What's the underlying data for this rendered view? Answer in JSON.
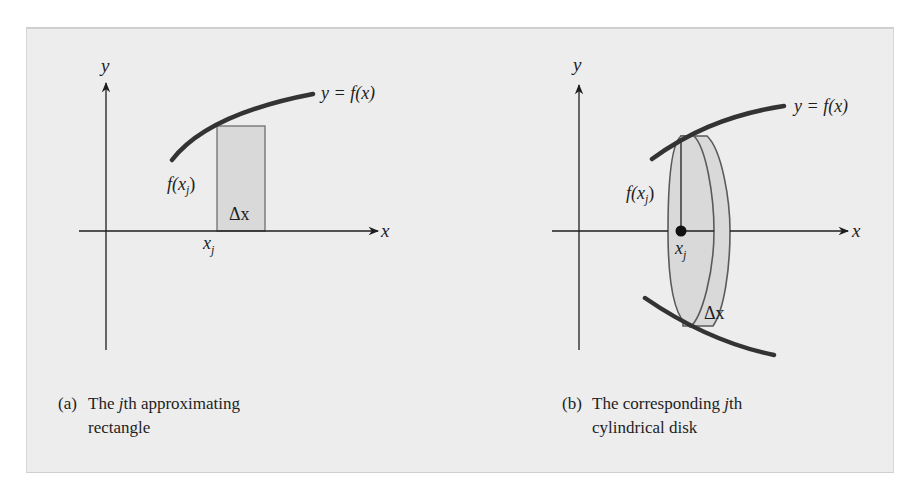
{
  "figure": {
    "panel_a": {
      "axis_x_label": "x",
      "axis_y_label": "y",
      "curve_label": "y = f(x)",
      "height_label": "f(x",
      "height_label_sub": "j",
      "height_label_close": ")",
      "width_label": "Δx",
      "point_label": "x",
      "point_label_sub": "j",
      "caption_tag": "(a)",
      "caption_line1_pre": "The ",
      "caption_line1_j": "j",
      "caption_line1_post": "th approximating",
      "caption_line2": "rectangle"
    },
    "panel_b": {
      "axis_x_label": "x",
      "axis_y_label": "y",
      "curve_label": "y = f(x)",
      "height_label": "f(x",
      "height_label_sub": "j",
      "height_label_close": ")",
      "width_label": "Δx",
      "point_label": "x",
      "point_label_sub": "j",
      "caption_tag": "(b)",
      "caption_line1_pre": "The corresponding ",
      "caption_line1_j": "j",
      "caption_line1_post": "th",
      "caption_line2": "cylindrical disk"
    },
    "colors": {
      "panel_background": "#ededed",
      "shape_fill": "#d9d9d9",
      "curve": "#333333",
      "axis": "#1e1e1e"
    }
  }
}
